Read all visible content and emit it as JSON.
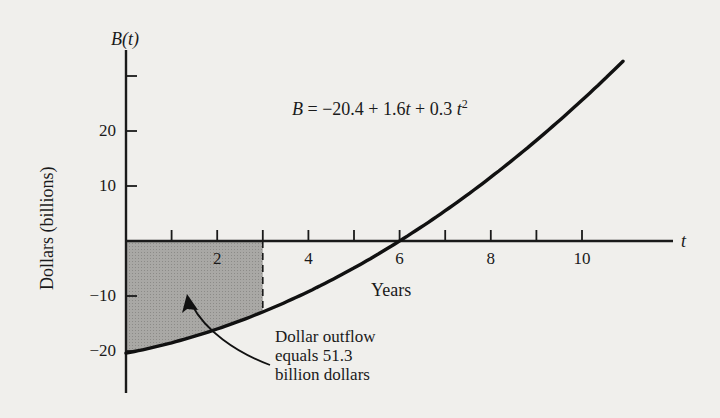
{
  "chart_data": {
    "type": "line",
    "title": "",
    "equation": "B = −20.4 + 1.6t + 0.3t²",
    "equation_parts": {
      "lhs": "B",
      "eq": " = −20.4 + 1.6",
      "t1": "t",
      "plus": " + 0.3 ",
      "t2": "t",
      "exp": "2"
    },
    "coefficients": {
      "a": -20.4,
      "b": 1.6,
      "c": 0.3
    },
    "xlabel": "Years",
    "x_axis_symbol": "t",
    "ylabel": "Dollars (billions)",
    "y_axis_symbol": "B(t)",
    "xlim": [
      0,
      11.7
    ],
    "ylim": [
      -28,
      36
    ],
    "x_ticks": [
      1,
      2,
      3,
      4,
      5,
      6,
      7,
      8,
      9,
      10
    ],
    "x_tick_labels": [
      "2",
      "4",
      "6",
      "8",
      "10"
    ],
    "x_tick_label_values": [
      2,
      4,
      6,
      8,
      10
    ],
    "y_ticks": [
      -20,
      -10,
      10,
      20,
      30
    ],
    "y_tick_labels": [
      "−20",
      "−10",
      "10",
      "20"
    ],
    "y_tick_label_values": [
      -20,
      -10,
      10,
      20
    ],
    "grid": false,
    "legend": null,
    "series": [
      {
        "name": "B(t)",
        "x": [
          0,
          1,
          2,
          3,
          4,
          5,
          6,
          7,
          8,
          9,
          10,
          10.9
        ],
        "values": [
          -20.4,
          -18.5,
          -16.0,
          -12.9,
          -9.2,
          -4.9,
          0.0,
          5.5,
          11.6,
          18.3,
          25.6,
          32.7
        ]
      }
    ],
    "shaded_region": {
      "from_t": 0,
      "to_t": 3,
      "description": "Area between curve and t-axis"
    },
    "annotation": {
      "lines": [
        "Dollar outflow",
        "equals 51.3",
        "billion dollars"
      ],
      "value": 51.3
    }
  }
}
